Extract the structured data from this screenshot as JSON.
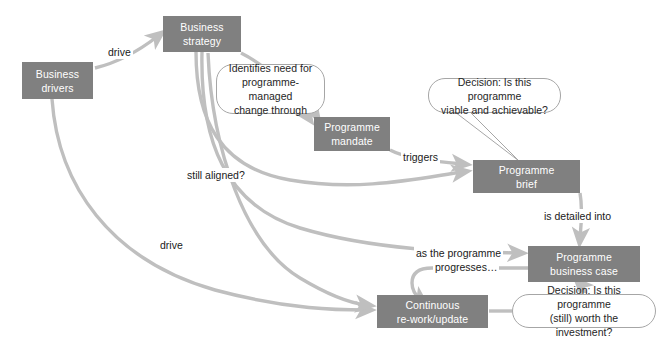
{
  "diagram": {
    "colors": {
      "node_fill": "#808080",
      "node_text": "#ffffff",
      "connector": "#bfbfbf",
      "callout_border": "#a6a6a6",
      "callout_fill": "#ffffff",
      "label_text": "#1a1a1a",
      "background": "#ffffff"
    },
    "nodes": [
      {
        "id": "business-drivers",
        "label": "Business drivers",
        "line1": "Business",
        "line2": "drivers"
      },
      {
        "id": "business-strategy",
        "label": "Business strategy",
        "line1": "Business",
        "line2": "strategy"
      },
      {
        "id": "programme-mandate",
        "label": "Programme mandate",
        "line1": "Programme",
        "line2": "mandate"
      },
      {
        "id": "programme-brief",
        "label": "Programme brief",
        "line1": "Programme",
        "line2": "brief"
      },
      {
        "id": "programme-business-case",
        "label": "Programme business case",
        "line1": "Programme",
        "line2": "business case"
      },
      {
        "id": "continuous-rework",
        "label": "Continuous re-work/update",
        "line1": "Continuous",
        "line2": "re-work/update"
      }
    ],
    "callouts": [
      {
        "id": "identifies-need",
        "line1": "Identifies need for",
        "line2": "programme-managed",
        "line3": "change through"
      },
      {
        "id": "decision-viable",
        "line1": "Decision: Is this programme",
        "line2": "viable and achievable?"
      },
      {
        "id": "decision-worth",
        "line1": "Decision: Is this programme",
        "line2": "(still) worth the investment?"
      }
    ],
    "edge_labels": [
      {
        "id": "drive-top",
        "text": "drive"
      },
      {
        "id": "drive-bottom",
        "text": "drive"
      },
      {
        "id": "still-aligned",
        "text": "still aligned?"
      },
      {
        "id": "triggers",
        "text": "triggers"
      },
      {
        "id": "is-detailed-into",
        "text": "is detailed into"
      },
      {
        "id": "as-the-programme-1",
        "text": "as the programme"
      },
      {
        "id": "as-the-programme-2",
        "text": "progresses…"
      }
    ]
  }
}
